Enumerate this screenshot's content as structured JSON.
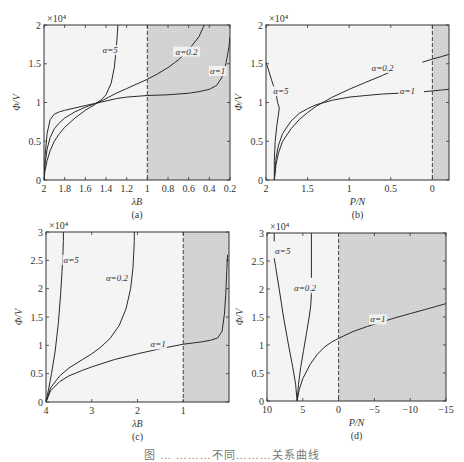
{
  "figure": {
    "caption": "图 … ………不同………关系曲线"
  },
  "chart_data": [
    {
      "id": "a",
      "type": "line",
      "panel_label": "(a)",
      "title": "",
      "xlabel": "λB",
      "ylabel": "Φ/V",
      "y_multiplier": "×10⁴",
      "xlim": [
        2,
        0.2
      ],
      "ylim": [
        0,
        2
      ],
      "x_reversed": true,
      "xticks": [
        2,
        1.8,
        1.6,
        1.4,
        1.2,
        1,
        0.8,
        0.6,
        0.4,
        0.2
      ],
      "xtick_labels": [
        "2",
        "1.8",
        "1.6",
        "1.4",
        "1.2",
        "1",
        "0.8",
        "0.6",
        "0.4",
        "0.2"
      ],
      "yticks": [
        0,
        0.5,
        1,
        1.5,
        2
      ],
      "ytick_labels": [
        "0",
        "0.5",
        "1",
        "1.5",
        "2"
      ],
      "dashed_line_x": 1,
      "shaded_region": [
        1,
        0.2
      ],
      "grid": false,
      "series": [
        {
          "name": "α=5",
          "label_pos": [
            1.36,
            1.65
          ],
          "x": [
            2,
            1.99,
            1.97,
            1.94,
            1.9,
            1.85,
            1.8,
            1.7,
            1.6,
            1.5,
            1.45,
            1.4,
            1.35,
            1.32,
            1.3,
            1.29,
            1.285
          ],
          "y": [
            0,
            0.3,
            0.6,
            0.78,
            0.85,
            0.88,
            0.9,
            0.93,
            0.96,
            0.99,
            1.03,
            1.1,
            1.25,
            1.45,
            1.7,
            1.9,
            2.0
          ]
        },
        {
          "name": "α=0.2",
          "label_pos": [
            0.62,
            1.63
          ],
          "x": [
            2,
            1.99,
            1.97,
            1.94,
            1.9,
            1.85,
            1.8,
            1.7,
            1.6,
            1.5,
            1.4,
            1.3,
            1.2,
            1.1,
            1.0,
            0.9,
            0.8,
            0.7,
            0.6,
            0.5,
            0.45
          ],
          "y": [
            0,
            0.12,
            0.25,
            0.38,
            0.5,
            0.6,
            0.68,
            0.8,
            0.9,
            0.98,
            1.05,
            1.12,
            1.18,
            1.24,
            1.3,
            1.37,
            1.45,
            1.55,
            1.68,
            1.85,
            2.0
          ]
        },
        {
          "name": "α=1",
          "label_pos": [
            0.32,
            1.38
          ],
          "x": [
            2,
            1.99,
            1.97,
            1.94,
            1.9,
            1.85,
            1.8,
            1.7,
            1.6,
            1.5,
            1.4,
            1.3,
            1.2,
            1.1,
            1.0,
            0.8,
            0.6,
            0.5,
            0.4,
            0.33,
            0.28,
            0.24,
            0.21,
            0.2
          ],
          "y": [
            0,
            0.2,
            0.4,
            0.55,
            0.66,
            0.74,
            0.8,
            0.88,
            0.94,
            0.99,
            1.02,
            1.05,
            1.07,
            1.08,
            1.09,
            1.1,
            1.12,
            1.14,
            1.17,
            1.22,
            1.32,
            1.5,
            1.72,
            1.85
          ]
        }
      ]
    },
    {
      "id": "b",
      "type": "line",
      "panel_label": "(b)",
      "title": "",
      "xlabel": "P/N",
      "ylabel": "Φ/V",
      "y_multiplier": "×10⁴",
      "xlim": [
        2,
        -0.2
      ],
      "ylim": [
        0,
        2
      ],
      "x_reversed": true,
      "xticks": [
        2,
        1.5,
        1,
        0.5,
        0
      ],
      "xtick_labels": [
        "2",
        "1.5",
        "1",
        "0.5",
        "0"
      ],
      "yticks": [
        0,
        0.5,
        1,
        1.5,
        2
      ],
      "ytick_labels": [
        "0",
        "0.5",
        "1",
        "1.5",
        "2"
      ],
      "dashed_line_x": 0,
      "shaded_region": [
        0,
        -0.2
      ],
      "grid": false,
      "series": [
        {
          "name": "α=5",
          "label_pos": [
            1.82,
            1.12
          ],
          "x": [
            1.9,
            1.9,
            1.89,
            1.87,
            1.85,
            1.84,
            1.86,
            1.88,
            1.93,
            1.97,
            2.0
          ],
          "y": [
            0,
            0.25,
            0.5,
            0.7,
            0.85,
            0.93,
            1.0,
            1.12,
            1.28,
            1.42,
            1.52
          ]
        },
        {
          "name": "α=0.2",
          "label_pos": [
            0.6,
            1.42
          ],
          "x": [
            1.9,
            1.88,
            1.85,
            1.8,
            1.7,
            1.6,
            1.5,
            1.4,
            1.3,
            1.2,
            1.0,
            0.8,
            0.6,
            0.5
          ],
          "y": [
            0,
            0.2,
            0.35,
            0.5,
            0.66,
            0.78,
            0.87,
            0.95,
            1.01,
            1.07,
            1.17,
            1.26,
            1.35,
            1.4
          ]
        },
        {
          "name": "α=1",
          "label_pos": [
            0.3,
            1.12
          ],
          "x": [
            1.9,
            1.88,
            1.85,
            1.8,
            1.7,
            1.6,
            1.5,
            1.4,
            1.3,
            1.2,
            1.0,
            0.8,
            0.6,
            0.4
          ],
          "y": [
            0,
            0.28,
            0.45,
            0.6,
            0.76,
            0.86,
            0.92,
            0.97,
            1.0,
            1.03,
            1.07,
            1.09,
            1.11,
            1.12
          ]
        },
        {
          "name": "α=0.2 (cont.)",
          "label_pos": null,
          "x": [
            0.12,
            0,
            -0.1,
            -0.2
          ],
          "y": [
            1.52,
            1.56,
            1.59,
            1.62
          ]
        },
        {
          "name": "α=1 (cont.)",
          "label_pos": null,
          "x": [
            0.1,
            0,
            -0.1,
            -0.2
          ],
          "y": [
            1.14,
            1.15,
            1.16,
            1.17
          ]
        }
      ]
    },
    {
      "id": "c",
      "type": "line",
      "panel_label": "(c)",
      "title": "",
      "xlabel": "λB",
      "ylabel": "Φ/V",
      "y_multiplier": "×10⁴",
      "xlim": [
        4,
        0
      ],
      "ylim": [
        0,
        3
      ],
      "x_reversed": true,
      "xticks": [
        4,
        3,
        2,
        1
      ],
      "xtick_labels": [
        "4",
        "3",
        "2",
        "1"
      ],
      "yticks": [
        0,
        0.5,
        1,
        1.5,
        2,
        2.5,
        3
      ],
      "ytick_labels": [
        "0",
        "0.5",
        "1",
        "1.5",
        "2",
        "2.5",
        "3"
      ],
      "dashed_line_x": 1,
      "shaded_region": [
        1,
        0
      ],
      "grid": false,
      "series": [
        {
          "name": "α=5",
          "label_pos": [
            3.45,
            2.47
          ],
          "x": [
            4,
            3.95,
            3.88,
            3.8,
            3.73,
            3.68,
            3.65,
            3.63,
            3.62,
            3.62
          ],
          "y": [
            0,
            0.2,
            0.5,
            0.9,
            1.4,
            1.9,
            2.3,
            2.6,
            2.85,
            3.0
          ]
        },
        {
          "name": "α=0.2",
          "label_pos": [
            2.45,
            2.15
          ],
          "x": [
            4,
            3.9,
            3.7,
            3.5,
            3.2,
            3.0,
            2.8,
            2.6,
            2.4,
            2.25,
            2.15,
            2.1,
            2.08,
            2.07,
            2.07
          ],
          "y": [
            0,
            0.25,
            0.46,
            0.6,
            0.75,
            0.85,
            0.97,
            1.12,
            1.35,
            1.65,
            2.0,
            2.35,
            2.65,
            2.85,
            3.0
          ]
        },
        {
          "name": "α=1",
          "label_pos": [
            1.55,
            0.98
          ],
          "x": [
            4,
            3.9,
            3.7,
            3.5,
            3.2,
            3.0,
            2.5,
            2.0,
            1.5,
            1.0,
            0.6,
            0.4,
            0.25,
            0.15,
            0.1,
            0.07,
            0.05,
            0.03
          ],
          "y": [
            0,
            0.2,
            0.36,
            0.46,
            0.56,
            0.62,
            0.75,
            0.85,
            0.94,
            1.02,
            1.06,
            1.09,
            1.13,
            1.25,
            1.55,
            1.9,
            2.3,
            2.6
          ]
        }
      ]
    },
    {
      "id": "d",
      "type": "line",
      "panel_label": "(d)",
      "title": "",
      "xlabel": "P/N",
      "ylabel": "Φ/V",
      "y_multiplier": "×10⁴",
      "xlim": [
        10,
        -15
      ],
      "ylim": [
        0,
        3
      ],
      "x_reversed": true,
      "xticks": [
        10,
        5,
        0,
        -5,
        -10,
        -15
      ],
      "xtick_labels": [
        "10",
        "5",
        "0",
        "−5",
        "−10",
        "−15"
      ],
      "yticks": [
        0,
        0.5,
        1,
        1.5,
        2,
        2.5,
        3
      ],
      "ytick_labels": [
        "0",
        "0.5",
        "1",
        "1.5",
        "2",
        "2.5",
        "3"
      ],
      "dashed_line_x": 0,
      "shaded_region": [
        0,
        -15
      ],
      "grid": false,
      "series": [
        {
          "name": "α=5",
          "label_pos": [
            7.8,
            2.65
          ],
          "x": [
            5.8,
            6.0,
            6.4,
            7.0,
            7.7,
            8.3,
            8.8,
            9.0
          ],
          "y": [
            0,
            0.3,
            0.6,
            1.0,
            1.5,
            2.0,
            2.4,
            2.55
          ]
        },
        {
          "name": "α=5 (top)",
          "label_pos": null,
          "x": [
            9.0,
            9.0
          ],
          "y": [
            2.85,
            3.0
          ]
        },
        {
          "name": "α=0.2",
          "label_pos": [
            4.7,
            1.98
          ],
          "x": [
            5.8,
            5.6,
            5.3,
            4.9,
            4.5,
            4.1,
            3.9,
            3.8,
            3.8
          ],
          "y": [
            0,
            0.3,
            0.6,
            0.9,
            1.2,
            1.5,
            1.7,
            1.9,
            2.0
          ]
        },
        {
          "name": "α=0.2 (top)",
          "label_pos": null,
          "x": [
            3.8,
            3.8
          ],
          "y": [
            2.2,
            3.0
          ]
        },
        {
          "name": "α=1",
          "label_pos": [
            -5.5,
            1.42
          ],
          "x": [
            5.8,
            5.5,
            5.0,
            4.0,
            3.0,
            2.0,
            1.0,
            0.0,
            -2.0,
            -4.0,
            -6.0,
            -8.0,
            -10.0,
            -12.0,
            -15.0
          ],
          "y": [
            0,
            0.2,
            0.4,
            0.65,
            0.83,
            0.96,
            1.05,
            1.12,
            1.24,
            1.33,
            1.41,
            1.49,
            1.56,
            1.63,
            1.74
          ]
        }
      ]
    }
  ],
  "panels_layout": [
    {
      "id": "a",
      "frame": [
        44,
        25,
        230,
        180
      ]
    },
    {
      "id": "b",
      "frame": [
        266,
        25,
        449,
        180
      ]
    },
    {
      "id": "c",
      "frame": [
        46,
        232,
        229,
        402
      ]
    },
    {
      "id": "d",
      "frame": [
        267,
        233,
        446,
        401
      ]
    }
  ]
}
